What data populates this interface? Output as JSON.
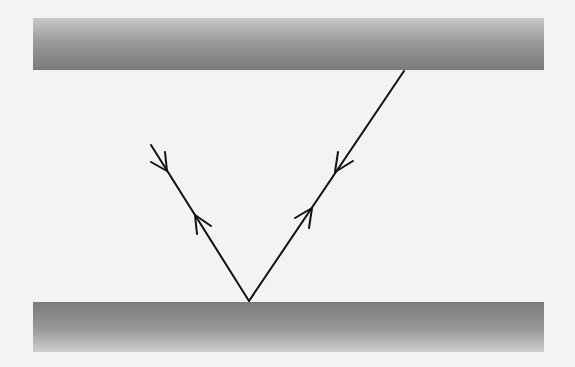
{
  "diagram": {
    "colors": {
      "background": "#f3f3f3",
      "plate_dark": "#7a7a7a",
      "plate_light": "#cfcfcf",
      "ray": "#111111"
    },
    "plates": [
      {
        "id": "top",
        "position": "top"
      },
      {
        "id": "bottom",
        "position": "bottom"
      }
    ],
    "rays": [
      {
        "id": "incident-right",
        "from": [
          404,
          71
        ],
        "to": [
          249,
          301
        ],
        "arrows": [
          "down-left",
          "up-right"
        ]
      },
      {
        "id": "left-ray",
        "from": [
          151,
          145
        ],
        "to": [
          249,
          301
        ],
        "arrows": [
          "down-right",
          "up-left"
        ]
      }
    ],
    "reflection_point": [
      249,
      301
    ]
  }
}
